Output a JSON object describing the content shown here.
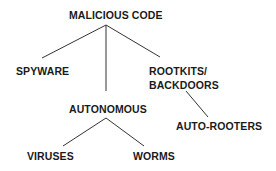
{
  "diagram": {
    "type": "tree",
    "root": {
      "id": "malicious-code",
      "label": "MALICIOUS CODE",
      "children": [
        {
          "id": "spyware",
          "label": "SPYWARE",
          "children": []
        },
        {
          "id": "autonomous",
          "label": "AUTONOMOUS",
          "children": [
            {
              "id": "viruses",
              "label": "VIRUSES",
              "children": []
            },
            {
              "id": "worms",
              "label": "WORMS",
              "children": []
            }
          ]
        },
        {
          "id": "rootkits-backdoors",
          "label": "ROOTKITS/ BACKDOORS",
          "label_lines": [
            "ROOTKITS/",
            "BACKDOORS"
          ],
          "children": [
            {
              "id": "auto-rooters",
              "label": "AUTO-ROOTERS",
              "children": []
            }
          ]
        }
      ]
    },
    "edges": [
      {
        "from": "malicious-code",
        "to": "spyware"
      },
      {
        "from": "malicious-code",
        "to": "autonomous"
      },
      {
        "from": "malicious-code",
        "to": "rootkits-backdoors"
      },
      {
        "from": "autonomous",
        "to": "viruses"
      },
      {
        "from": "autonomous",
        "to": "worms"
      },
      {
        "from": "rootkits-backdoors",
        "to": "auto-rooters"
      }
    ]
  },
  "labels": {
    "malicious_code": "MALICIOUS CODE",
    "spyware": "SPYWARE",
    "rootkits_line1": "ROOTKITS/",
    "rootkits_line2": "BACKDOORS",
    "autonomous": "AUTONOMOUS",
    "auto_rooters": "AUTO-ROOTERS",
    "viruses": "VIRUSES",
    "worms": "WORMS"
  },
  "colors": {
    "text": "#1a1a1a",
    "lines": "#333333",
    "background": "#ffffff"
  }
}
